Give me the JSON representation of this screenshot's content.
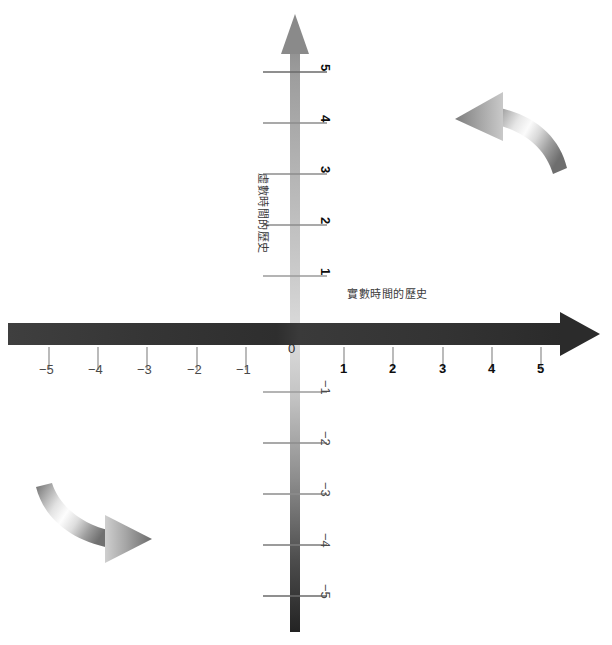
{
  "figure": {
    "kind": "complex-time-diagram",
    "background_color": "#ffffff",
    "width": 612,
    "height": 645
  },
  "axes": {
    "horizontal": {
      "title": "實數時間的歷史",
      "title_x": 347,
      "title_y": 289,
      "color_dark": "#3a3a3a",
      "color_darkest": "#2b2b2b",
      "arrowhead": "right",
      "y": 335,
      "origin_x": 295,
      "tick_spacing": 49.2,
      "ticks": [
        {
          "label": "−5",
          "value": -5
        },
        {
          "label": "−4",
          "value": -4
        },
        {
          "label": "−3",
          "value": -3
        },
        {
          "label": "−2",
          "value": -2
        },
        {
          "label": "−1",
          "value": -1
        },
        {
          "label": "1",
          "value": 1
        },
        {
          "label": "2",
          "value": 2
        },
        {
          "label": "3",
          "value": 3
        },
        {
          "label": "4",
          "value": 4
        },
        {
          "label": "5",
          "value": 5
        }
      ]
    },
    "vertical": {
      "title": "虛數時間的歷史",
      "title_x": 262,
      "title_y": 175,
      "color_light": "#c9c9c9",
      "color_dark": "#2b2b2b",
      "arrowhead": "up",
      "x": 295,
      "origin_y": 335,
      "tick_spacing": 51.0,
      "ticks": [
        {
          "label": "5",
          "value": 5
        },
        {
          "label": "4",
          "value": 4
        },
        {
          "label": "3",
          "value": 3
        },
        {
          "label": "2",
          "value": 2
        },
        {
          "label": "1",
          "value": 1
        },
        {
          "label": "−1",
          "value": -1
        },
        {
          "label": "−2",
          "value": -2
        },
        {
          "label": "−3",
          "value": -3
        },
        {
          "label": "−4",
          "value": -4
        },
        {
          "label": "−5",
          "value": -5
        }
      ]
    },
    "origin_label": "0"
  },
  "curved_arrows": [
    {
      "name": "top-right-arrow",
      "direction": "counterclockwise-left",
      "points_to": "left"
    },
    {
      "name": "bottom-left-arrow",
      "direction": "clockwise-right",
      "points_to": "right"
    }
  ]
}
